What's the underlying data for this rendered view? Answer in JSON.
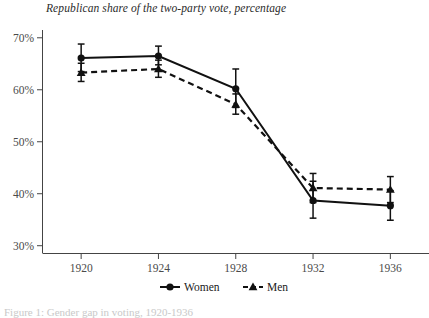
{
  "chart_data": {
    "type": "line",
    "title": "Republican share of the two-party vote, percentage",
    "xlabel": "",
    "ylabel": "",
    "categories": [
      "1920",
      "1924",
      "1928",
      "1932",
      "1936"
    ],
    "x": [
      1920,
      1924,
      1928,
      1932,
      1936
    ],
    "xlim": [
      1918,
      1938
    ],
    "ylim": [
      28.5,
      71.5
    ],
    "yticks": [
      30,
      40,
      50,
      60,
      70
    ],
    "ytick_labels": [
      "30%",
      "40%",
      "50%",
      "60%",
      "70%"
    ],
    "xticks": [
      1920,
      1924,
      1928,
      1932,
      1936
    ],
    "grid": false,
    "legend_position": "bottom-center",
    "series": [
      {
        "name": "Women",
        "line_style": "solid",
        "marker": "circle",
        "color": "#111111",
        "values": [
          66.1,
          66.5,
          60.2,
          38.7,
          37.7
        ],
        "error_low": [
          63.5,
          64.8,
          56.6,
          35.3,
          34.9
        ],
        "error_high": [
          68.8,
          68.4,
          64.0,
          42.4,
          40.6
        ]
      },
      {
        "name": "Men",
        "line_style": "dashed",
        "marker": "triangle",
        "color": "#111111",
        "values": [
          63.3,
          64.0,
          57.2,
          41.1,
          40.8
        ],
        "error_low": [
          61.6,
          62.4,
          55.3,
          38.3,
          38.3
        ],
        "error_high": [
          65.1,
          65.7,
          59.2,
          43.9,
          43.3
        ]
      }
    ]
  },
  "legend": {
    "entries": [
      {
        "label": "Women"
      },
      {
        "label": "Men"
      }
    ]
  },
  "caption": {
    "text": "Figure 1: Gender gap in voting, 1920-1936"
  }
}
